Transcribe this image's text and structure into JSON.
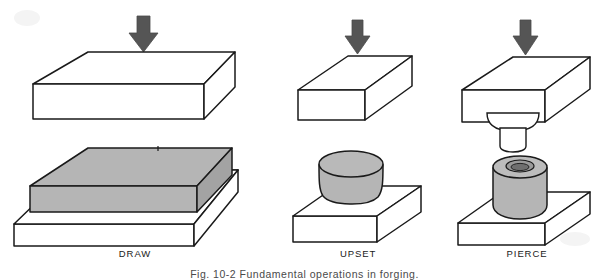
{
  "figure": {
    "caption": "Fig. 10-2  Fundamental operations in forging.",
    "background_color": "#ffffff",
    "line_color": "#1a1a1a",
    "workpiece_fill": "#b3b3b3",
    "die_fill": "#ffffff",
    "arrow_color": "#555555"
  },
  "columns": [
    {
      "id": "draw",
      "label": "DRAW",
      "label_x": 135,
      "label_y": 248,
      "tool_shape": "flat-rectangular-die",
      "result_shape": "flat-rectangular-slab-on-base",
      "arrow": "down-arrow-icon"
    },
    {
      "id": "upset",
      "label": "UPSET",
      "label_x": 353,
      "label_y": 248,
      "tool_shape": "small-rectangular-die",
      "result_shape": "squat-cylinder-on-base",
      "arrow": "down-arrow-icon"
    },
    {
      "id": "pierce",
      "label": "PIERCE",
      "label_x": 527,
      "label_y": 248,
      "tool_shape": "rectangular-die-with-round-punch",
      "result_shape": "pierced-cylinder-on-base",
      "arrow": "down-arrow-icon"
    }
  ]
}
